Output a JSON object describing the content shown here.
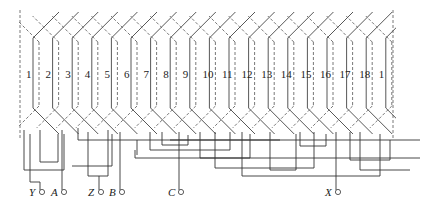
{
  "diagram": {
    "type": "three-phase stator winding expansion diagram",
    "slots": [
      "1",
      "2",
      "3",
      "4",
      "5",
      "6",
      "7",
      "8",
      "9",
      "10",
      "11",
      "12",
      "13",
      "14",
      "15",
      "16",
      "17",
      "18",
      "1"
    ],
    "terminals": [
      {
        "label": "Y",
        "x": 40
      },
      {
        "label": "A",
        "x": 62
      },
      {
        "label": "Z",
        "x": 99
      },
      {
        "label": "B",
        "x": 120
      },
      {
        "label": "C",
        "x": 179
      },
      {
        "label": "X",
        "x": 336
      }
    ]
  },
  "style": {
    "line_color": "#444444",
    "background": "#ffffff"
  }
}
